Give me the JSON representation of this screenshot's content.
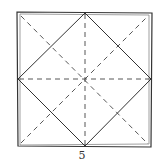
{
  "diagram": {
    "type": "origami-fold-diagram",
    "step_label": "5",
    "colors": {
      "line": "#333333",
      "background": "#ffffff"
    },
    "outer_square": {
      "corners": [
        [
          18,
          13
        ],
        [
          151,
          13
        ],
        [
          151,
          146
        ],
        [
          18,
          146
        ]
      ],
      "style": "double-solid"
    },
    "diamond": {
      "points": [
        [
          85,
          13
        ],
        [
          151,
          79
        ],
        [
          85,
          146
        ],
        [
          18,
          79
        ]
      ],
      "style": "solid"
    },
    "creases": [
      {
        "name": "diagonal-tl-br",
        "from": [
          20,
          15
        ],
        "to": [
          149,
          144
        ],
        "style": "dashed"
      },
      {
        "name": "diagonal-bl-tr",
        "from": [
          20,
          144
        ],
        "to": [
          149,
          15
        ],
        "style": "dashed"
      },
      {
        "name": "horizontal-midline",
        "from": [
          18,
          79
        ],
        "to": [
          151,
          79
        ],
        "style": "dashed"
      },
      {
        "name": "vertical-midline",
        "from": [
          85,
          13
        ],
        "to": [
          85,
          146
        ],
        "style": "dashed"
      }
    ]
  }
}
